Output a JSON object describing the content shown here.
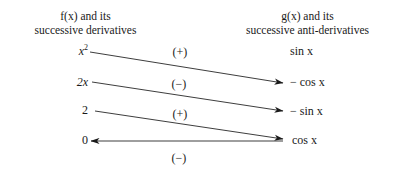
{
  "figure": {
    "background_color": "#ffffff",
    "ink_color": "#1a1a1a"
  },
  "headings": {
    "left": {
      "line1_prefix": "f",
      "line1": "f(x) and its",
      "line2": "successive derivatives"
    },
    "right": {
      "line1": "g(x) and its",
      "line2": "successive anti-derivatives"
    }
  },
  "left_column": {
    "label": "f(x) and its successive derivatives",
    "terms": [
      {
        "text": "x²",
        "base": "x",
        "exponent": "2"
      },
      {
        "text": "2x",
        "base": "2x",
        "exponent": ""
      },
      {
        "text": "2",
        "base": "2",
        "exponent": ""
      },
      {
        "text": "0",
        "base": "0",
        "exponent": ""
      }
    ]
  },
  "right_column": {
    "label": "g(x) and its successive anti-derivatives",
    "terms": [
      {
        "text": "sin x"
      },
      {
        "text": "− cos x"
      },
      {
        "text": "− sin x"
      },
      {
        "text": "cos x"
      }
    ]
  },
  "signs": [
    {
      "text": "(+)",
      "value": "+"
    },
    {
      "text": "(−)",
      "value": "-"
    },
    {
      "text": "(+)",
      "value": "+"
    },
    {
      "text": "(−)",
      "value": "-"
    }
  ],
  "arrows": [
    {
      "name": "arrow-x2-to-minus-cos",
      "from_term": "x²",
      "to_term": "− cos x",
      "sign": "(+)",
      "direction": "right-down",
      "x1": 90,
      "y1": 52,
      "x2": 283,
      "y2": 83
    },
    {
      "name": "arrow-2x-to-minus-sin",
      "from_term": "2x",
      "to_term": "− sin x",
      "sign": "(−)",
      "direction": "right-down",
      "x1": 92,
      "y1": 82,
      "x2": 283,
      "y2": 111
    },
    {
      "name": "arrow-2-to-cos",
      "from_term": "2",
      "to_term": "cos x",
      "sign": "(+)",
      "direction": "right-down",
      "x1": 95,
      "y1": 111,
      "x2": 283,
      "y2": 139
    },
    {
      "name": "arrow-cos-to-zero",
      "from_term": "cos x",
      "to_term": "0",
      "sign": "(−)",
      "direction": "left",
      "x1": 283,
      "y1": 141,
      "x2": 91,
      "y2": 141
    }
  ]
}
